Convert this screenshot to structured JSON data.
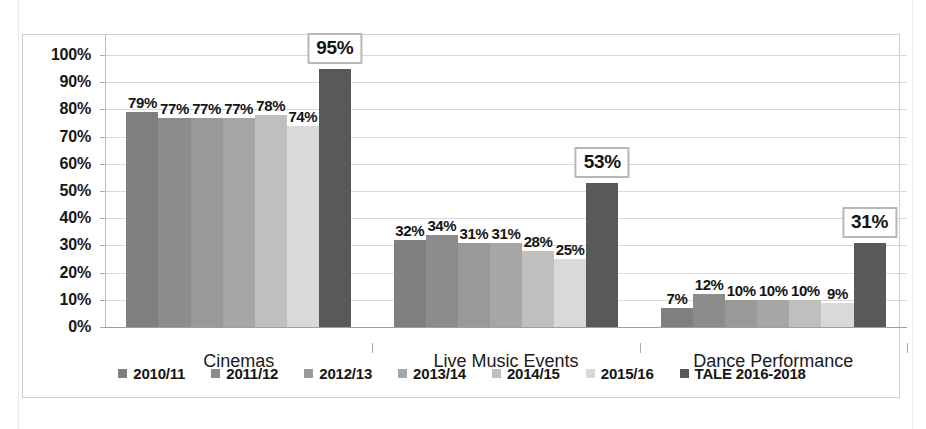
{
  "chart_data": {
    "type": "bar",
    "title": "",
    "xlabel": "",
    "ylabel": "",
    "ylim": [
      0,
      100
    ],
    "ytick_labels": [
      "100%",
      "90%",
      "80%",
      "70%",
      "60%",
      "50%",
      "40%",
      "30%",
      "20%",
      "10%",
      "0%"
    ],
    "ytick_values": [
      100,
      90,
      80,
      70,
      60,
      50,
      40,
      30,
      20,
      10,
      0
    ],
    "grid": true,
    "legend_position": "bottom",
    "value_suffix": "%",
    "categories": [
      "Cinemas",
      "Live Music Events",
      "Dance Performance"
    ],
    "series": [
      {
        "name": "2010/11",
        "color": "#7f7f7f",
        "values": [
          79,
          32,
          7
        ],
        "labels": [
          "79%",
          "32%",
          "7%"
        ],
        "highlight": false
      },
      {
        "name": "2011/12",
        "color": "#8c8c8c",
        "values": [
          77,
          34,
          12
        ],
        "labels": [
          "77%",
          "34%",
          "12%"
        ],
        "highlight": false
      },
      {
        "name": "2012/13",
        "color": "#999999",
        "values": [
          77,
          31,
          10
        ],
        "labels": [
          "77%",
          "31%",
          "10%"
        ],
        "highlight": false
      },
      {
        "name": "2013/14",
        "color": "#a6a6a6",
        "values": [
          77,
          31,
          10
        ],
        "labels": [
          "77%",
          "31%",
          "10%"
        ],
        "highlight": false
      },
      {
        "name": "2014/15",
        "color": "#bfbfbf",
        "values": [
          78,
          28,
          10
        ],
        "labels": [
          "78%",
          "28%",
          "10%"
        ],
        "highlight": false
      },
      {
        "name": "2015/16",
        "color": "#d9d9d9",
        "values": [
          74,
          25,
          9
        ],
        "labels": [
          "74%",
          "25%",
          "9%"
        ],
        "highlight": false
      },
      {
        "name": "TALE 2016-2018",
        "color": "#595959",
        "values": [
          95,
          53,
          31
        ],
        "labels": [
          "95%",
          "53%",
          "31%"
        ],
        "highlight": true
      }
    ]
  },
  "colors": {
    "gridline": "#d8d8d8",
    "axis": "#a8a8a8",
    "frame": "#cfcfcf",
    "text": "#161616",
    "highlight_box_border": "#b7b7b7",
    "highlight_box_fill": "#ffffff"
  }
}
